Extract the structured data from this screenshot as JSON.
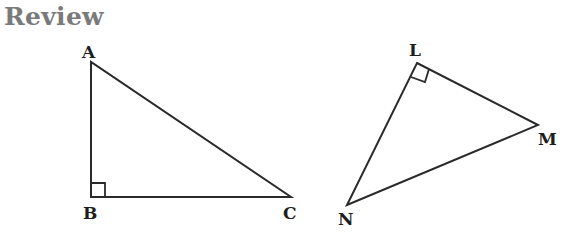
{
  "title": "Review",
  "triangles": [
    {
      "name": "ABC",
      "vertices": {
        "A": {
          "label": "A",
          "x": 91,
          "y": 62
        },
        "B": {
          "label": "B",
          "x": 91,
          "y": 197
        },
        "C": {
          "label": "C",
          "x": 291,
          "y": 197
        }
      },
      "right_angle_at": "B"
    },
    {
      "name": "LMN",
      "vertices": {
        "L": {
          "label": "L",
          "x": 417,
          "y": 63
        },
        "M": {
          "label": "M",
          "x": 538,
          "y": 125
        },
        "N": {
          "label": "N",
          "x": 347,
          "y": 205
        }
      },
      "right_angle_at": "L"
    }
  ],
  "colors": {
    "title": "#7a7a7a",
    "stroke": "#2a2a2a"
  }
}
